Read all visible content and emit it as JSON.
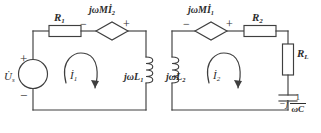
{
  "diagram": {
    "background_color": "#ffffff",
    "line_color": "#3f3f3f",
    "text_color": "#2e2e2e"
  },
  "left_mesh": {
    "source": {
      "label": "U̇",
      "subscript": "s",
      "plus_sign": "+",
      "minus_sign": "−",
      "type": "voltage-source"
    },
    "resistor": {
      "label": "R",
      "subscript": "1"
    },
    "dependent_source": {
      "label_prefix": "jωM",
      "label_current": "İ",
      "label_subscript": "2",
      "minus_sign": "−",
      "plus_sign": "+",
      "type": "dependent-voltage-source"
    },
    "inductor": {
      "label_prefix": "jωL",
      "subscript": "1"
    },
    "mesh_current": {
      "label": "İ",
      "subscript": "1",
      "direction": "clockwise"
    }
  },
  "right_mesh": {
    "dependent_source": {
      "label_prefix": "jωM",
      "label_current": "İ",
      "label_subscript": "1",
      "minus_sign": "−",
      "plus_sign": "+",
      "type": "dependent-voltage-source"
    },
    "resistor_series": {
      "label": "R",
      "subscript": "2"
    },
    "resistor_load": {
      "label": "R",
      "subscript": "L"
    },
    "capacitor": {
      "prefix": "−j",
      "numerator": "1",
      "denominator": "ωC",
      "type": "capacitor"
    },
    "inductor": {
      "label_prefix": "jωL",
      "subscript": "2"
    },
    "mesh_current": {
      "label": "İ",
      "subscript": "2",
      "direction": "clockwise"
    }
  }
}
